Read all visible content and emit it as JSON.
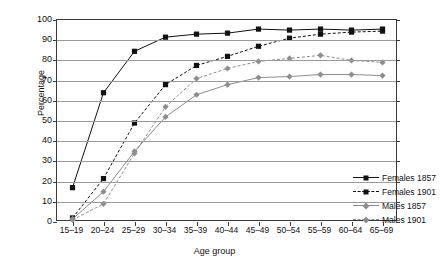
{
  "chart_data": {
    "type": "line",
    "title": "",
    "xlabel": "Age group",
    "ylabel": "Percentage",
    "ylim": [
      0,
      100
    ],
    "ytick_step": 10,
    "grid": "horizontal",
    "legend_position": "inside lower-right",
    "categories": [
      "15–19",
      "20–24",
      "25–29",
      "30–34",
      "35–39",
      "40–44",
      "45–49",
      "50–54",
      "55–59",
      "60–64",
      "65–69"
    ],
    "yticks": [
      "0",
      "10",
      "20",
      "30",
      "40",
      "50",
      "60",
      "70",
      "80",
      "90",
      "100"
    ],
    "series": [
      {
        "name": "Females 1857",
        "color": "#111111",
        "marker": "square",
        "linestyle": "solid",
        "values": [
          17,
          64,
          84.5,
          91.5,
          93,
          93.5,
          95.5,
          95,
          95.5,
          95,
          95.5
        ]
      },
      {
        "name": "Females 1901",
        "color": "#111111",
        "marker": "square",
        "linestyle": "dashed",
        "values": [
          2,
          21.5,
          49,
          68,
          77.5,
          82,
          87,
          91,
          93,
          94,
          94.5
        ]
      },
      {
        "name": "Males 1857",
        "color": "#8d8d8d",
        "marker": "diamond",
        "linestyle": "solid",
        "values": [
          1.5,
          15,
          35,
          52,
          63,
          68,
          71.5,
          72,
          73,
          73,
          72.5
        ]
      },
      {
        "name": "Males 1901",
        "color": "#8d8d8d",
        "marker": "diamond",
        "linestyle": "dashed",
        "values": [
          1,
          9,
          34,
          57,
          71,
          76,
          79.5,
          81,
          82.5,
          80,
          79
        ]
      }
    ]
  }
}
